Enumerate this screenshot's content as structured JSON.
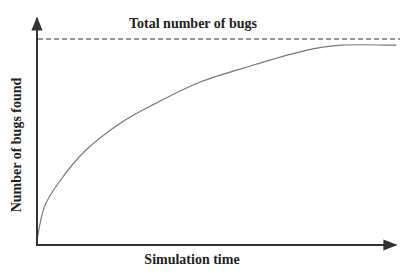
{
  "chart_data": {
    "type": "line",
    "title": "",
    "xlabel": "Simulation time",
    "ylabel": "Number of bugs found",
    "x_ticks": [],
    "y_ticks": [],
    "grid": false,
    "legend": null,
    "annotations": [
      {
        "text": "Total number of bugs",
        "type": "horizontal-dashed-asymptote",
        "y": 1.0
      }
    ],
    "series": [
      {
        "name": "Bugs found",
        "style": "solid",
        "color": "#777777",
        "x": [
          0.0,
          0.02,
          0.06,
          0.13,
          0.23,
          0.32,
          0.45,
          0.59,
          0.73,
          0.84,
          0.99
        ],
        "y": [
          0.02,
          0.18,
          0.3,
          0.45,
          0.59,
          0.68,
          0.79,
          0.87,
          0.94,
          0.97,
          0.97
        ]
      },
      {
        "name": "Total number of bugs",
        "style": "dashed",
        "color": "#333333",
        "x": [
          0.0,
          1.0
        ],
        "y": [
          1.0,
          1.0
        ]
      }
    ],
    "xlim": [
      0,
      1
    ],
    "ylim": [
      0,
      1.05
    ]
  },
  "colors": {
    "axis": "#333333",
    "curve": "#777777",
    "asymptote": "#333333",
    "text": "#222222"
  }
}
